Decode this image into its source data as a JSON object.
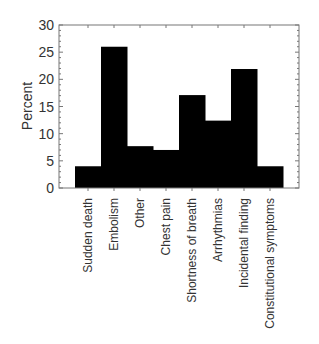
{
  "chart_data": {
    "type": "bar",
    "title": "",
    "xlabel": "",
    "ylabel": "Percent",
    "ylim": [
      0,
      30
    ],
    "yticks": [
      0,
      5,
      10,
      15,
      20,
      25,
      30
    ],
    "grid": false,
    "legend": null,
    "categories": [
      "Sudden death",
      "Embolism",
      "Other",
      "Chest pain",
      "Shortness of breath",
      "Arrhythmias",
      "Incidental finding",
      "Constitutional symptoms"
    ],
    "values": [
      4,
      26,
      7.7,
      7,
      17.1,
      12.4,
      21.9,
      4
    ],
    "bar_color": "#000000"
  }
}
